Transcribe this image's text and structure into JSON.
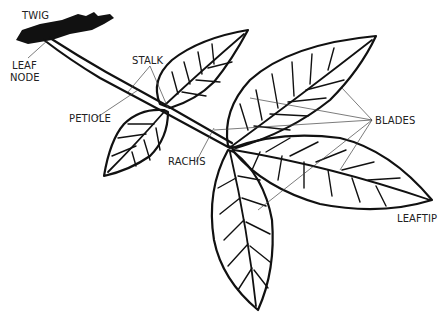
{
  "diagram": {
    "labels": {
      "twig": "TWIG",
      "leaf_node_1": "LEAF",
      "leaf_node_2": "NODE",
      "stalk": "STALK",
      "petiole": "PETIOLE",
      "rachis": "RACHIS",
      "blades": "BLADES",
      "leaftip": "LEAFTIP"
    },
    "colors": {
      "ink": "#111111",
      "pointer": "#444444",
      "background": "#ffffff"
    }
  }
}
